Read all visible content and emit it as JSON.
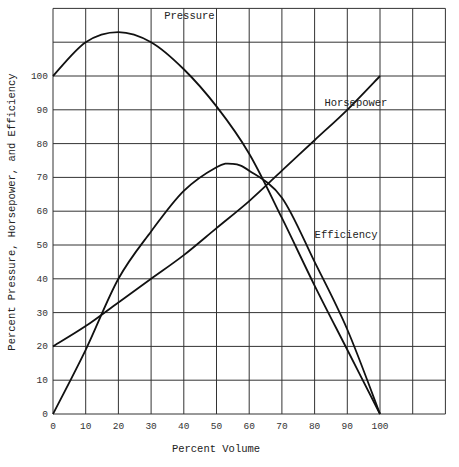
{
  "chart_data": {
    "type": "line",
    "title": "",
    "xlabel": "Percent Volume",
    "ylabel": "Percent Pressure, Horsepower, and Efficiency",
    "xlim": [
      0,
      120
    ],
    "ylim": [
      0,
      120
    ],
    "grid": true,
    "x_ticks": [
      0,
      10,
      20,
      30,
      40,
      50,
      60,
      70,
      80,
      90,
      100
    ],
    "y_ticks": [
      0,
      10,
      20,
      30,
      40,
      50,
      60,
      70,
      80,
      90,
      100
    ],
    "legend": "inline labels",
    "series": [
      {
        "name": "Pressure",
        "x": [
          0,
          10,
          20,
          30,
          40,
          50,
          60,
          70,
          80,
          90,
          100
        ],
        "values": [
          100,
          110,
          113,
          110,
          102,
          91,
          77,
          58,
          38,
          19,
          0
        ],
        "label_pos": [
          34,
          117
        ]
      },
      {
        "name": "Horsepower",
        "x": [
          0,
          10,
          20,
          30,
          40,
          50,
          60,
          70,
          80,
          90,
          100
        ],
        "values": [
          20,
          26,
          33,
          40,
          47,
          55,
          63,
          72,
          81,
          90,
          100
        ],
        "label_pos": [
          83,
          91
        ]
      },
      {
        "name": "Efficiency",
        "x": [
          0,
          10,
          20,
          30,
          40,
          50,
          55,
          60,
          70,
          80,
          90,
          100
        ],
        "values": [
          0,
          19,
          40,
          54,
          66,
          73,
          74,
          72,
          64,
          45,
          25,
          0
        ],
        "label_pos": [
          80,
          52
        ]
      }
    ]
  }
}
